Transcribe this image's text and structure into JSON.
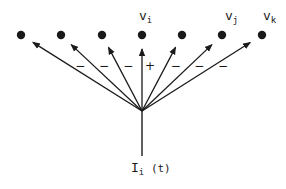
{
  "diagram": {
    "input_label": {
      "main": "I",
      "sub": "i",
      "suffix": "(t)"
    },
    "nodes": [
      {
        "id": "n1",
        "label": null,
        "sign": "−"
      },
      {
        "id": "n2",
        "label": null,
        "sign": "−"
      },
      {
        "id": "n3",
        "label": null,
        "sign": "−"
      },
      {
        "id": "vi",
        "label": {
          "main": "v",
          "sub": "i"
        },
        "sign": "+"
      },
      {
        "id": "n5",
        "label": null,
        "sign": "−"
      },
      {
        "id": "vj",
        "label": {
          "main": "v",
          "sub": "j"
        },
        "sign": "−"
      },
      {
        "id": "vk",
        "label": {
          "main": "v",
          "sub": "k"
        },
        "sign": "−"
      }
    ],
    "colors": {
      "ink": "#1a1a1a",
      "background": "#ffffff"
    }
  }
}
